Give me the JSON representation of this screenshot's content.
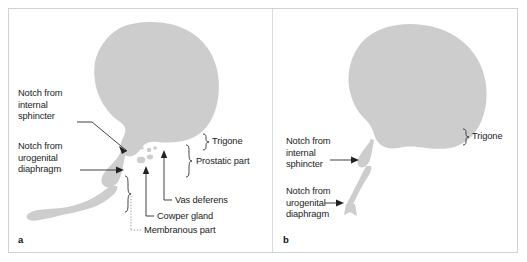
{
  "figure": {
    "background_color": "#ffffff",
    "frame_color": "#d2d2d2",
    "organ_fill_color": "#cdcdcd",
    "line_color": "#222222",
    "text_color": "#1c1c1c"
  },
  "panels": [
    {
      "letter": "a",
      "labels": {
        "notch_internal_sphincter": "Notch from\ninternal\nsphincter",
        "notch_urogenital_diaphragm": "Notch from\nurogenital\ndiaphragm",
        "trigone": "Trigone",
        "prostatic_part": "Prostatic part",
        "vas_deferens": "Vas deferens",
        "cowper_gland": "Cowper gland",
        "membranous_part": "Membranous part"
      }
    },
    {
      "letter": "b",
      "labels": {
        "notch_internal_sphincter": "Notch from\ninternal\nsphincter",
        "notch_urogenital_diaphragm": "Notch from\nurogenital\ndiaphragm",
        "trigone": "Trigone"
      }
    }
  ]
}
